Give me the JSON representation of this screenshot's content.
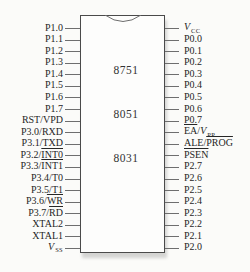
{
  "chip": {
    "labels": [
      "8751",
      "8051",
      "8031"
    ]
  },
  "pins": {
    "left": [
      {
        "pre": "P1.0"
      },
      {
        "pre": "P1.1"
      },
      {
        "pre": "P1.2"
      },
      {
        "pre": "P1.3"
      },
      {
        "pre": "P1.4"
      },
      {
        "pre": "P1.5"
      },
      {
        "pre": "P1.6"
      },
      {
        "pre": "P1.7"
      },
      {
        "pre": "RST/VPD"
      },
      {
        "pre": "P3.0/RXD"
      },
      {
        "pre": "P3.1/TXD"
      },
      {
        "pre": "P3.2/",
        "over": "INT0"
      },
      {
        "pre": "P3.3/",
        "over": "INT1"
      },
      {
        "pre": "P3.4/T0"
      },
      {
        "pre": "P3.5/T1"
      },
      {
        "pre": "P3.6/",
        "over": "WR"
      },
      {
        "pre": "P3.7/",
        "over": "RD"
      },
      {
        "pre": "XTAL2"
      },
      {
        "pre": "XTAL1"
      },
      {
        "it": "V",
        "sub": "SS"
      }
    ],
    "right": [
      {
        "it": "V",
        "sub": "CC"
      },
      {
        "pre": "P0.0"
      },
      {
        "pre": "P0.1"
      },
      {
        "pre": "P0.2"
      },
      {
        "pre": "P0.3"
      },
      {
        "pre": "P0.4"
      },
      {
        "pre": "P0.5"
      },
      {
        "pre": "P0.6"
      },
      {
        "pre": "P0.7"
      },
      {
        "over": "EA",
        "post": "/",
        "it": "V",
        "sub": "PP"
      },
      {
        "pre": "ALE/",
        "over": "PROG"
      },
      {
        "over": "PSEN"
      },
      {
        "pre": "P2.7"
      },
      {
        "pre": "P2.6"
      },
      {
        "pre": "P2.5"
      },
      {
        "pre": "P2.4"
      },
      {
        "pre": "P2.3"
      },
      {
        "pre": "P2.2"
      },
      {
        "pre": "P2.1"
      },
      {
        "pre": "P2.0"
      }
    ]
  },
  "colors": {
    "line": "#6e6e6e",
    "chip_border": "#4a4a4a",
    "text": "#262626",
    "background": "#fbfbf9"
  }
}
